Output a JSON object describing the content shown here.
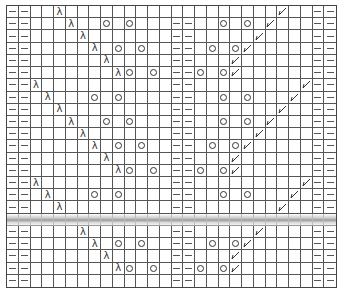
{
  "chart": {
    "columns": 28,
    "rows": 23,
    "legend_symbols": {
      "-": "purl-dash",
      "O": "yarn-over-circle",
      "L": "left-lambda-decrease",
      "K": "right-slant-decrease"
    },
    "grid": [
      "--..L..................K..--",
      "--...L..O.O...--..O.O.K...--",
      "--....L.......--.....K....--",
      "--.....L.O.O..--.O.OK.....--",
      "--......L.....--...K......--",
      "--.......LO.O.--O.OK......--",
      "--L...........--.........K--",
      "--.L...O.O....--..O.O...K.--",
      "--..L.........--.......K..--",
      "--...L..O.O...--..O.O.K...--",
      "--....L.......--.....K....--",
      "--.....L.O.O..--.O.OK.....--",
      "--......L.....--...K......--",
      "--.......LO.O.--O.OK......--",
      "--L...........--.........K--",
      "--.L...O.O....--..O.O...K.--",
      "--..L.........--.......K..--",
      "~",
      "--....L.......--.....K....--",
      "--.....L.O.O..--.O.OK.....--",
      "--......L.....--...K......--",
      "--.......LO.O.--O.OK......--",
      "--............--..........--"
    ]
  }
}
